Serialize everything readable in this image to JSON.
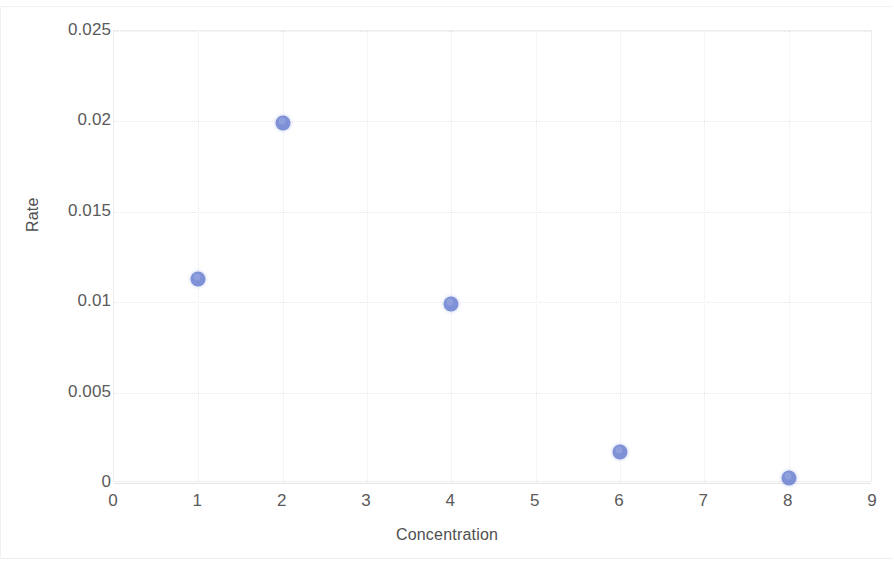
{
  "chart_data": {
    "type": "scatter",
    "title": "",
    "xlabel": "Concentration",
    "ylabel": "Rate",
    "xlim": [
      0,
      9
    ],
    "ylim": [
      0,
      0.025
    ],
    "grid": true,
    "legend": "none",
    "marker_color": "#7e90d6",
    "x_ticks": [
      "0",
      "1",
      "2",
      "3",
      "4",
      "5",
      "6",
      "7",
      "8",
      "9"
    ],
    "y_ticks": [
      "0",
      "0.005",
      "0.01",
      "0.015",
      "0.02",
      "0.025"
    ],
    "x_tick_values": [
      0,
      1,
      2,
      3,
      4,
      5,
      6,
      7,
      8,
      9
    ],
    "y_tick_values": [
      0,
      0.005,
      0.01,
      0.015,
      0.02,
      0.025
    ],
    "series": [
      {
        "name": "Rate vs Concentration",
        "x": [
          1,
          2,
          4,
          6,
          8
        ],
        "y": [
          0.0113,
          0.0199,
          0.0099,
          0.0017,
          0.0003
        ],
        "points": [
          {
            "x": 1,
            "y": 0.0113
          },
          {
            "x": 2,
            "y": 0.0199
          },
          {
            "x": 4,
            "y": 0.0099
          },
          {
            "x": 6,
            "y": 0.0017
          },
          {
            "x": 8,
            "y": 0.0003
          }
        ]
      }
    ]
  }
}
